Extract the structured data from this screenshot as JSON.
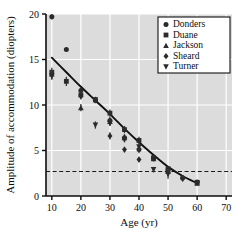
{
  "chart_data": {
    "type": "scatter",
    "title": "",
    "xlabel": "Age (yr)",
    "ylabel": "Amplitude of accommodation (diopters)",
    "xlim": [
      8,
      72
    ],
    "ylim": [
      0,
      20
    ],
    "xticks": [
      10,
      20,
      30,
      40,
      50,
      60,
      70
    ],
    "yticks": [
      0,
      5,
      10,
      15,
      20
    ],
    "grid": true,
    "grid_color": "#ffffff",
    "plot_background": "#dcdcdc",
    "legend_position": "top-right",
    "legend_entries": [
      {
        "name": "Donders",
        "marker": "circle"
      },
      {
        "name": "Duane",
        "marker": "square"
      },
      {
        "name": "Jackson",
        "marker": "triangle-up"
      },
      {
        "name": "Sheard",
        "marker": "diamond"
      },
      {
        "name": "Turner",
        "marker": "triangle-down"
      }
    ],
    "reference_line": {
      "type": "horizontal-dashed",
      "y": 2.7,
      "label": ""
    },
    "fit_curve": {
      "name": "fitted decline",
      "style": "solid-black",
      "points": [
        {
          "x": 10,
          "y": 15.2
        },
        {
          "x": 15,
          "y": 13.6
        },
        {
          "x": 20,
          "y": 12.0
        },
        {
          "x": 25,
          "y": 10.5
        },
        {
          "x": 30,
          "y": 9.0
        },
        {
          "x": 35,
          "y": 7.4
        },
        {
          "x": 40,
          "y": 5.9
        },
        {
          "x": 45,
          "y": 4.5
        },
        {
          "x": 50,
          "y": 3.2
        },
        {
          "x": 55,
          "y": 2.2
        },
        {
          "x": 60,
          "y": 1.4
        }
      ]
    },
    "series": [
      {
        "name": "Donders",
        "marker": "circle",
        "points": [
          {
            "x": 10,
            "y": 19.7,
            "err": 0.3
          },
          {
            "x": 15,
            "y": 16.1,
            "err": 0.2
          },
          {
            "x": 20,
            "y": 11.6,
            "err": 0.3
          },
          {
            "x": 25,
            "y": 10.5,
            "err": 0.3
          },
          {
            "x": 30,
            "y": 8.3,
            "err": 0.4
          },
          {
            "x": 35,
            "y": 6.4,
            "err": 0.4
          },
          {
            "x": 40,
            "y": 5.1,
            "err": 0.4
          },
          {
            "x": 45,
            "y": 4.2,
            "err": 0.3
          },
          {
            "x": 50,
            "y": 2.9,
            "err": 0.3
          },
          {
            "x": 55,
            "y": 2.0,
            "err": 0.3
          },
          {
            "x": 60,
            "y": 1.5,
            "err": 0.3
          }
        ]
      },
      {
        "name": "Duane",
        "marker": "square",
        "points": [
          {
            "x": 10,
            "y": 13.6,
            "err": 0.5
          },
          {
            "x": 15,
            "y": 12.6,
            "err": 0.5
          },
          {
            "x": 20,
            "y": 11.1,
            "err": 0.4
          },
          {
            "x": 25,
            "y": 10.6,
            "err": 0.3
          },
          {
            "x": 30,
            "y": 9.1,
            "err": 0.4
          },
          {
            "x": 35,
            "y": 7.3,
            "err": 0.4
          },
          {
            "x": 40,
            "y": 6.1,
            "err": 0.4
          },
          {
            "x": 45,
            "y": 4.2,
            "err": 0.3
          },
          {
            "x": 50,
            "y": 3.0,
            "err": 0.3
          },
          {
            "x": 60,
            "y": 1.5,
            "err": 0.2
          }
        ]
      },
      {
        "name": "Jackson",
        "marker": "triangle-up",
        "points": [
          {
            "x": 10,
            "y": 13.4,
            "err": 0.4
          },
          {
            "x": 20,
            "y": 9.7,
            "err": 0.4
          },
          {
            "x": 30,
            "y": 8.2,
            "err": 0.4
          },
          {
            "x": 35,
            "y": 6.4,
            "err": 0.3
          },
          {
            "x": 45,
            "y": 4.1,
            "err": 0.3
          },
          {
            "x": 50,
            "y": 2.7,
            "err": 0.3
          },
          {
            "x": 60,
            "y": 1.4,
            "err": 0.2
          }
        ]
      },
      {
        "name": "Sheard",
        "marker": "diamond",
        "points": [
          {
            "x": 10,
            "y": 13.3,
            "err": 0.5
          },
          {
            "x": 20,
            "y": 11.0,
            "err": 0.4
          },
          {
            "x": 30,
            "y": 6.6,
            "err": 0.4
          },
          {
            "x": 35,
            "y": 5.1,
            "err": 0.3
          },
          {
            "x": 40,
            "y": 4.0,
            "err": 0.3
          },
          {
            "x": 50,
            "y": 2.6,
            "err": 0.4
          },
          {
            "x": 55,
            "y": 1.9,
            "err": 0.3
          }
        ]
      },
      {
        "name": "Turner",
        "marker": "triangle-down",
        "points": [
          {
            "x": 10,
            "y": 13.2,
            "err": 0.4
          },
          {
            "x": 25,
            "y": 7.8,
            "err": 0.4
          },
          {
            "x": 30,
            "y": 8.0,
            "err": 0.3
          },
          {
            "x": 35,
            "y": 6.2,
            "err": 0.3
          },
          {
            "x": 40,
            "y": 5.4,
            "err": 0.4
          },
          {
            "x": 45,
            "y": 2.9,
            "err": 0.3
          },
          {
            "x": 50,
            "y": 2.4,
            "err": 0.5
          },
          {
            "x": 60,
            "y": 1.4,
            "err": 0.2
          }
        ]
      }
    ]
  }
}
